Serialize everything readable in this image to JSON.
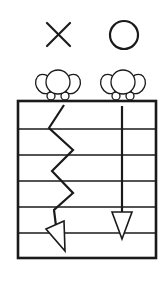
{
  "diagram": {
    "colors": {
      "stroke": "#1a1a1a",
      "background": "#ffffff"
    },
    "columns": [
      {
        "id": "wrong",
        "mark": "×",
        "mark_meaning": "incorrect",
        "icon": "cross-icon",
        "path_type": "zigzag"
      },
      {
        "id": "correct",
        "mark": "○",
        "mark_meaning": "correct",
        "icon": "circle-icon",
        "path_type": "straight"
      }
    ],
    "grid": {
      "horizontal_lines": 5,
      "rows": 6
    }
  }
}
